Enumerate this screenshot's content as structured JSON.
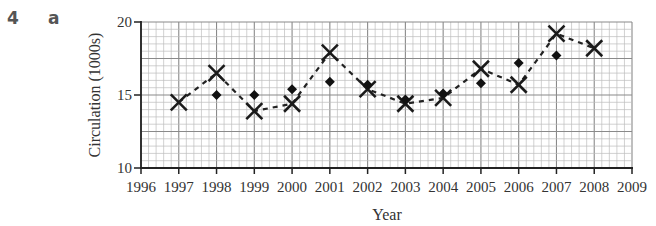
{
  "question": {
    "number": "4",
    "part": "a"
  },
  "chart_data": {
    "type": "scatter",
    "title": "",
    "xlabel": "Year",
    "ylabel": "Circulation (1000s)",
    "xlim": [
      1996,
      2009
    ],
    "ylim": [
      10,
      20
    ],
    "x_ticks": [
      "1996",
      "1997",
      "1998",
      "1999",
      "2000",
      "2001",
      "2002",
      "2003",
      "2004",
      "2005",
      "2006",
      "2007",
      "2008",
      "2009"
    ],
    "y_ticks": [
      "10",
      "15",
      "20"
    ],
    "grid": true,
    "legend": null,
    "series": [
      {
        "name": "Circulation (crosses, joined by dashed line)",
        "marker": "x",
        "line": "dashed",
        "x": [
          1997,
          1998,
          1999,
          2000,
          2001,
          2002,
          2003,
          2004,
          2005,
          2006,
          2007,
          2008
        ],
        "values": [
          14.5,
          16.5,
          13.9,
          14.4,
          17.9,
          15.4,
          14.4,
          14.8,
          16.8,
          15.7,
          19.2,
          18.2
        ]
      },
      {
        "name": "Circulation (diamonds)",
        "marker": "diamond",
        "line": "none",
        "x": [
          1998,
          1999,
          2000,
          2001,
          2002,
          2003,
          2004,
          2005,
          2006,
          2007
        ],
        "values": [
          15.0,
          15.0,
          15.4,
          15.9,
          15.7,
          14.7,
          15.1,
          15.8,
          17.2,
          17.7
        ]
      }
    ]
  }
}
